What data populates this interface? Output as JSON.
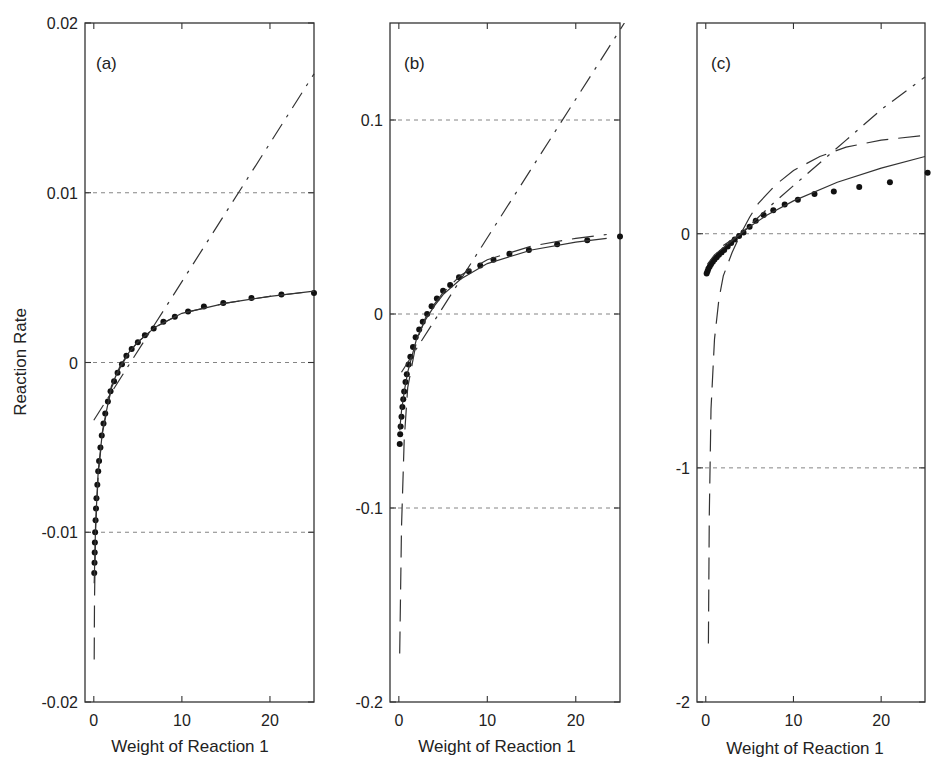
{
  "chart_data": [
    {
      "type": "line",
      "panel_label": "(a)",
      "xlabel": "Weight of Reaction 1",
      "ylabel": "Reaction Rate",
      "xlim": [
        -1,
        25
      ],
      "ylim": [
        -0.02,
        0.02
      ],
      "xticks": [
        0,
        10,
        20
      ],
      "xtick_labels": [
        "0",
        "10",
        "20"
      ],
      "yticks": [
        0.02,
        0.01,
        0,
        -0.01,
        -0.02
      ],
      "ytick_labels": [
        "0.02",
        "0.01",
        "0",
        "-0.01",
        "-0.02"
      ],
      "grid_y": [
        0.01,
        0,
        -0.01
      ],
      "series": [
        {
          "name": "data",
          "style": "dots",
          "x": [
            0.05,
            0.08,
            0.1,
            0.12,
            0.15,
            0.2,
            0.25,
            0.3,
            0.4,
            0.5,
            0.6,
            0.75,
            0.9,
            1.1,
            1.3,
            1.6,
            1.9,
            2.3,
            2.7,
            3.2,
            3.7,
            4.3,
            5.0,
            5.8,
            6.8,
            7.9,
            9.2,
            10.7,
            12.5,
            14.7,
            17.9,
            21.3,
            25
          ],
          "y": [
            -0.0124,
            -0.0118,
            -0.0112,
            -0.0106,
            -0.01,
            -0.0093,
            -0.0086,
            -0.008,
            -0.0072,
            -0.0064,
            -0.0058,
            -0.005,
            -0.0043,
            -0.0036,
            -0.003,
            -0.0023,
            -0.0017,
            -0.0011,
            -0.0006,
            -0.0001,
            0.0004,
            0.0008,
            0.0012,
            0.0016,
            0.002,
            0.0024,
            0.0027,
            0.003,
            0.0033,
            0.0035,
            0.0038,
            0.004,
            0.0041
          ]
        },
        {
          "name": "fit solid",
          "style": "solid",
          "x": [
            0.05,
            0.2,
            0.5,
            1,
            2,
            3,
            4,
            5,
            7,
            10,
            15,
            20,
            25
          ],
          "y": [
            -0.013,
            -0.0095,
            -0.0064,
            -0.004,
            -0.0014,
            -0.0002,
            0.0006,
            0.0012,
            0.0021,
            0.0029,
            0.0035,
            0.0039,
            0.0042
          ]
        },
        {
          "name": "fit dashed",
          "style": "dashed",
          "x": [
            0.05,
            0.08,
            0.2,
            0.5,
            1,
            2,
            3,
            4,
            5,
            7,
            10,
            15,
            20,
            25
          ],
          "y": [
            -0.0175,
            -0.014,
            -0.0098,
            -0.0066,
            -0.0041,
            -0.0015,
            -0.0003,
            0.0006,
            0.0012,
            0.0021,
            0.0029,
            0.0035,
            0.0039,
            0.0042
          ]
        },
        {
          "name": "linear dash-dot",
          "style": "dashdot",
          "x": [
            0,
            25
          ],
          "y": [
            -0.0034,
            0.017
          ]
        }
      ]
    },
    {
      "type": "line",
      "panel_label": "(b)",
      "xlabel": "Weight of Reaction 1",
      "ylabel": "",
      "xlim": [
        -1,
        25
      ],
      "ylim": [
        -0.2,
        0.15
      ],
      "xticks": [
        0,
        10,
        20
      ],
      "xtick_labels": [
        "0",
        "10",
        "20"
      ],
      "yticks": [
        0.1,
        0,
        -0.1,
        -0.2
      ],
      "ytick_labels": [
        "0.1",
        "0",
        "-0.1",
        "-0.2"
      ],
      "grid_y": [
        0.1,
        0,
        -0.1
      ],
      "series": [
        {
          "name": "data",
          "style": "dots",
          "x": [
            0.1,
            0.15,
            0.2,
            0.3,
            0.4,
            0.5,
            0.6,
            0.75,
            0.9,
            1.1,
            1.3,
            1.6,
            1.9,
            2.3,
            2.7,
            3.2,
            3.7,
            4.3,
            5.0,
            5.8,
            6.8,
            7.9,
            9.2,
            10.7,
            12.5,
            14.7,
            17.9,
            21.3,
            25
          ],
          "y": [
            -0.067,
            -0.062,
            -0.058,
            -0.053,
            -0.048,
            -0.044,
            -0.04,
            -0.035,
            -0.031,
            -0.026,
            -0.022,
            -0.017,
            -0.012,
            -0.008,
            -0.004,
            0.0,
            0.004,
            0.008,
            0.012,
            0.015,
            0.019,
            0.022,
            0.025,
            0.028,
            0.031,
            0.033,
            0.036,
            0.038,
            0.04
          ]
        },
        {
          "name": "fit solid",
          "style": "solid",
          "x": [
            0.1,
            0.3,
            0.6,
            1,
            2,
            3,
            4,
            5,
            7,
            10,
            15,
            20,
            23.5
          ],
          "y": [
            -0.06,
            -0.05,
            -0.04,
            -0.03,
            -0.013,
            -0.003,
            0.004,
            0.01,
            0.018,
            0.026,
            0.033,
            0.037,
            0.039
          ]
        },
        {
          "name": "fit dashed",
          "style": "dashed",
          "x": [
            0.1,
            0.3,
            0.6,
            1,
            2,
            3,
            4,
            5,
            7,
            10,
            15,
            20,
            23.5
          ],
          "y": [
            -0.175,
            -0.11,
            -0.065,
            -0.038,
            -0.014,
            -0.002,
            0.005,
            0.011,
            0.02,
            0.028,
            0.035,
            0.039,
            0.041
          ]
        },
        {
          "name": "linear dash-dot",
          "style": "dashdot",
          "x": [
            0.3,
            25.5
          ],
          "y": [
            -0.03,
            0.15
          ]
        }
      ]
    },
    {
      "type": "line",
      "panel_label": "(c)",
      "xlabel": "Weight of Reaction 1",
      "ylabel": "",
      "xlim": [
        -1,
        25
      ],
      "ylim": [
        -2,
        0.9
      ],
      "xticks": [
        0,
        10,
        20
      ],
      "xtick_labels": [
        "0",
        "10",
        "20"
      ],
      "yticks": [
        0,
        -1,
        -2
      ],
      "ytick_labels": [
        "0",
        "-1",
        "-2"
      ],
      "grid_y": [
        0,
        -1
      ],
      "series": [
        {
          "name": "data",
          "style": "dots",
          "x": [
            0.1,
            0.2,
            0.3,
            0.45,
            0.6,
            0.8,
            1.0,
            1.25,
            1.5,
            1.8,
            2.1,
            2.5,
            2.9,
            3.3,
            3.8,
            4.3,
            5.0,
            5.7,
            6.6,
            7.7,
            9.0,
            10.5,
            12.4,
            14.6,
            17.5,
            21.0,
            25.3
          ],
          "y": [
            -0.17,
            -0.16,
            -0.15,
            -0.14,
            -0.13,
            -0.12,
            -0.11,
            -0.1,
            -0.09,
            -0.08,
            -0.07,
            -0.055,
            -0.04,
            -0.025,
            -0.01,
            0.005,
            0.03,
            0.055,
            0.08,
            0.1,
            0.125,
            0.145,
            0.17,
            0.18,
            0.2,
            0.22,
            0.26
          ]
        },
        {
          "name": "fit solid",
          "style": "solid",
          "x": [
            0.2,
            1,
            2,
            3,
            4,
            5,
            7,
            10,
            15,
            20,
            25
          ],
          "y": [
            -0.13,
            -0.09,
            -0.06,
            -0.03,
            0.0,
            0.03,
            0.08,
            0.14,
            0.22,
            0.28,
            0.33
          ]
        },
        {
          "name": "fit long dash",
          "style": "dashed",
          "x": [
            0.3,
            0.4,
            0.6,
            1,
            1.5,
            2,
            3,
            4,
            5,
            6,
            8,
            10,
            13,
            16,
            20,
            25
          ],
          "y": [
            -1.75,
            -1.2,
            -0.75,
            -0.45,
            -0.28,
            -0.18,
            -0.08,
            0.0,
            0.07,
            0.13,
            0.21,
            0.27,
            0.33,
            0.37,
            0.4,
            0.42
          ]
        },
        {
          "name": "linear dash-dot",
          "style": "dashdot",
          "x": [
            2,
            4,
            8,
            12,
            16,
            20,
            25
          ],
          "y": [
            -0.05,
            0.0,
            0.14,
            0.27,
            0.4,
            0.53,
            0.67
          ]
        }
      ]
    }
  ],
  "panels": [
    {
      "label": "(a)",
      "box": {
        "left": 85,
        "top": 23,
        "right": 314,
        "bottom": 702
      }
    },
    {
      "label": "(b)",
      "box": {
        "left": 390,
        "top": 23,
        "right": 620,
        "bottom": 702
      }
    },
    {
      "label": "(c)",
      "box": {
        "left": 697,
        "top": 23,
        "right": 925,
        "bottom": 702
      }
    }
  ],
  "labels": {
    "ylabel": "Reaction Rate",
    "xlabel_a": "Weight of Reaction 1",
    "xlabel_b": "Weight of Reaction 1",
    "xlabel_c": "Weight of Reaction 1",
    "panel_a": "(a)",
    "panel_b": "(b)",
    "panel_c": "(c)"
  }
}
